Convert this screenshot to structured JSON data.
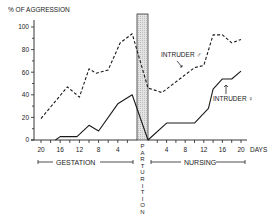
{
  "chart_data": {
    "type": "line",
    "title": "",
    "ylabel": "% OF AGGRESSION",
    "xlabel": "DAYS",
    "ylim": [
      0,
      100
    ],
    "yticks": [
      0,
      20,
      40,
      60,
      80,
      100
    ],
    "grid": false,
    "phases": [
      {
        "name": "GESTATION",
        "x_ticks": [
          20,
          16,
          12,
          8,
          4
        ],
        "x_direction": "days before parturition"
      },
      {
        "name": "PARTURITION",
        "label_vertical": "PARTURITION"
      },
      {
        "name": "NURSING",
        "x_ticks": [
          4,
          8,
          12,
          16,
          20
        ],
        "x_direction": "days after parturition"
      }
    ],
    "series": [
      {
        "name": "INTRUDER ♂",
        "style": "dashed",
        "gestation": [
          [
            20,
            19
          ],
          [
            14.5,
            47
          ],
          [
            12,
            38
          ],
          [
            10,
            63
          ],
          [
            8.5,
            59
          ],
          [
            6,
            62
          ],
          [
            3.5,
            86
          ],
          [
            1,
            94
          ]
        ],
        "nursing": [
          [
            0,
            46
          ],
          [
            3,
            42
          ],
          [
            10,
            64
          ],
          [
            12,
            66
          ],
          [
            14,
            93
          ],
          [
            16,
            93
          ],
          [
            18,
            86
          ],
          [
            20,
            89
          ]
        ]
      },
      {
        "name": "INTRUDER ♀",
        "style": "solid",
        "gestation": [
          [
            17,
            0
          ],
          [
            16,
            3
          ],
          [
            12.5,
            3
          ],
          [
            10,
            13
          ],
          [
            8,
            8
          ],
          [
            4,
            32
          ],
          [
            1,
            40
          ]
        ],
        "nursing": [
          [
            0,
            0
          ],
          [
            4,
            15
          ],
          [
            10,
            15
          ],
          [
            13,
            28
          ],
          [
            14,
            45
          ],
          [
            16,
            54
          ],
          [
            18,
            54
          ],
          [
            20,
            61
          ]
        ]
      }
    ],
    "annotations": [
      "INTRUDER ♂",
      "INTRUDER ♀"
    ]
  },
  "labels": {
    "y_axis": "% OF AGGRESSION",
    "days": "DAYS",
    "gestation": "GESTATION",
    "nursing": "NURSING",
    "parturition_letters": [
      "P",
      "A",
      "R",
      "T",
      "U",
      "R",
      "I",
      "T",
      "I",
      "O",
      "N"
    ],
    "male": "INTRUDER ♂",
    "female": "INTRUDER ♀"
  }
}
